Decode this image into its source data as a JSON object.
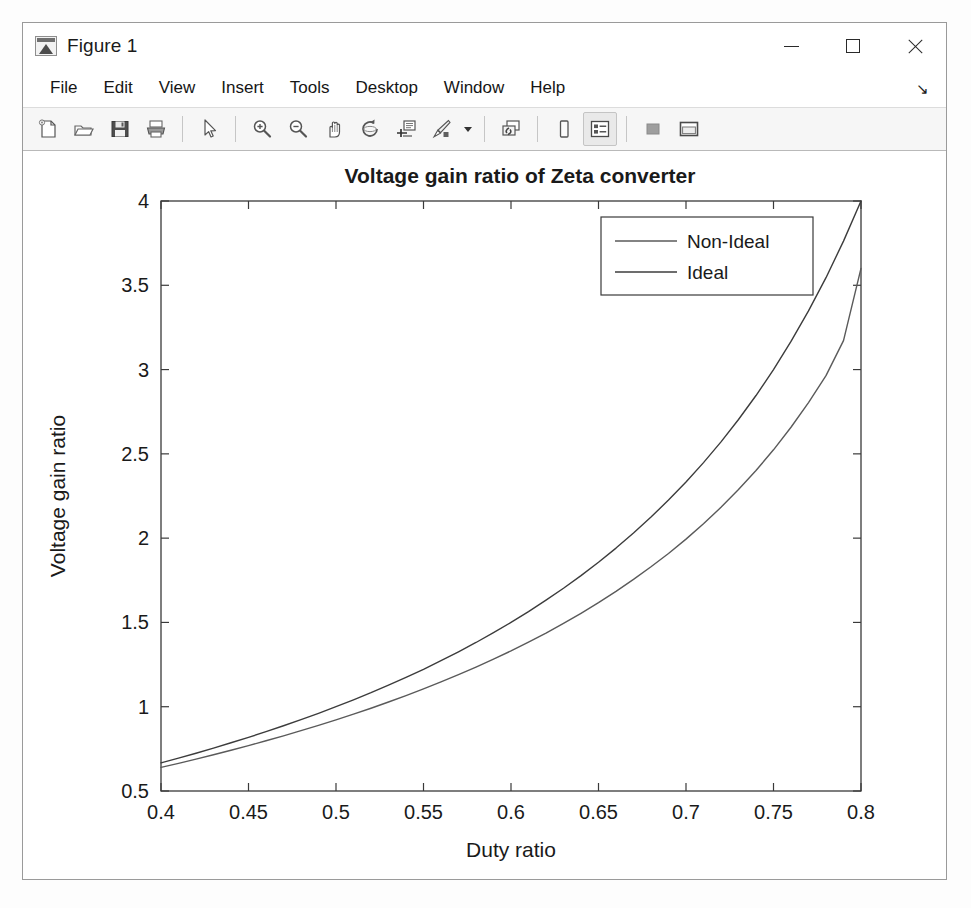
{
  "window": {
    "title": "Figure 1",
    "app_icon": "matlab-figure-icon",
    "controls": {
      "minimize": "—",
      "maximize": "□",
      "close": "✕"
    }
  },
  "menu": {
    "items": [
      {
        "label": "File"
      },
      {
        "label": "Edit"
      },
      {
        "label": "View"
      },
      {
        "label": "Insert"
      },
      {
        "label": "Tools"
      },
      {
        "label": "Desktop"
      },
      {
        "label": "Window"
      },
      {
        "label": "Help"
      }
    ],
    "dock_arrow": "↘"
  },
  "toolbar": {
    "buttons": [
      {
        "name": "new-figure-icon",
        "label": "New Figure",
        "active": false
      },
      {
        "name": "open-file-icon",
        "label": "Open File",
        "active": false
      },
      {
        "name": "save-figure-icon",
        "label": "Save Figure",
        "active": false
      },
      {
        "name": "print-figure-icon",
        "label": "Print Figure",
        "active": false
      },
      {
        "name": "pointer-arrow-icon",
        "label": "Edit Plot",
        "active": false
      },
      {
        "name": "zoom-in-icon",
        "label": "Zoom In",
        "active": false
      },
      {
        "name": "zoom-out-icon",
        "label": "Zoom Out",
        "active": false
      },
      {
        "name": "pan-hand-icon",
        "label": "Pan",
        "active": false
      },
      {
        "name": "rotate-3d-icon",
        "label": "Rotate 3D",
        "active": false
      },
      {
        "name": "data-cursor-icon",
        "label": "Data Cursor",
        "active": false
      },
      {
        "name": "brush-icon",
        "label": "Brush/Select Data",
        "active": false
      },
      {
        "name": "link-plot-icon",
        "label": "Link Plot",
        "active": false
      },
      {
        "name": "colorbar-icon",
        "label": "Insert Colorbar",
        "active": false
      },
      {
        "name": "legend-icon",
        "label": "Insert Legend",
        "active": true
      },
      {
        "name": "hide-plot-tools-icon",
        "label": "Hide Plot Tools",
        "active": false
      },
      {
        "name": "show-plot-tools-icon",
        "label": "Show Plot Tools",
        "active": false
      }
    ]
  },
  "chart_data": {
    "type": "line",
    "title": "Voltage gain ratio of Zeta converter",
    "xlabel": "Duty ratio",
    "ylabel": "Voltage gain ratio",
    "xlim": [
      0.4,
      0.8
    ],
    "ylim": [
      0.5,
      4.0
    ],
    "xticks": [
      "0.4",
      "0.45",
      "0.5",
      "0.55",
      "0.6",
      "0.65",
      "0.7",
      "0.75",
      "0.8"
    ],
    "xtick_values": [
      0.4,
      0.45,
      0.5,
      0.55,
      0.6,
      0.65,
      0.7,
      0.75,
      0.8
    ],
    "yticks": [
      "0.5",
      "1",
      "1.5",
      "2",
      "2.5",
      "3",
      "3.5",
      "4"
    ],
    "ytick_values": [
      0.5,
      1,
      1.5,
      2,
      2.5,
      3,
      3.5,
      4
    ],
    "grid": false,
    "legend_position": "north-east",
    "box": true,
    "x": [
      0.4,
      0.41,
      0.42,
      0.43,
      0.44,
      0.45,
      0.46,
      0.47,
      0.48,
      0.49,
      0.5,
      0.51,
      0.52,
      0.53,
      0.54,
      0.55,
      0.56,
      0.57,
      0.58,
      0.59,
      0.6,
      0.61,
      0.62,
      0.63,
      0.64,
      0.65,
      0.66,
      0.67,
      0.68,
      0.69,
      0.7,
      0.71,
      0.72,
      0.73,
      0.74,
      0.75,
      0.76,
      0.77,
      0.78,
      0.79,
      0.8
    ],
    "series": [
      {
        "name": "Non-Ideal",
        "color": "#5a5a5a",
        "width": 1.4,
        "values": [
          0.64,
          0.664,
          0.689,
          0.715,
          0.742,
          0.769,
          0.798,
          0.827,
          0.858,
          0.889,
          0.922,
          0.956,
          0.991,
          1.028,
          1.066,
          1.106,
          1.147,
          1.19,
          1.235,
          1.282,
          1.331,
          1.383,
          1.437,
          1.494,
          1.554,
          1.617,
          1.684,
          1.755,
          1.83,
          1.909,
          1.994,
          2.085,
          2.183,
          2.288,
          2.401,
          2.524,
          2.658,
          2.804,
          2.964,
          3.172,
          3.6
        ]
      },
      {
        "name": "Ideal",
        "color": "#3c3c3c",
        "width": 1.4,
        "values": [
          0.667,
          0.695,
          0.724,
          0.754,
          0.786,
          0.818,
          0.852,
          0.887,
          0.923,
          0.961,
          1.0,
          1.041,
          1.083,
          1.128,
          1.174,
          1.222,
          1.273,
          1.326,
          1.381,
          1.439,
          1.5,
          1.564,
          1.632,
          1.703,
          1.778,
          1.857,
          1.941,
          2.03,
          2.125,
          2.226,
          2.333,
          2.448,
          2.571,
          2.704,
          2.846,
          3.0,
          3.167,
          3.348,
          3.545,
          3.762,
          4.0
        ]
      }
    ]
  }
}
